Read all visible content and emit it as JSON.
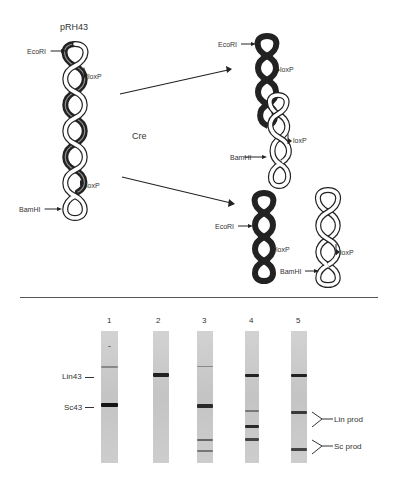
{
  "figure": {
    "top_panel": {
      "plasmid_name": "pRH43",
      "enzyme_label": "Cre",
      "substrate": {
        "labels": {
          "eco": "EcoRI",
          "loxp_top": "loxP",
          "loxp_bottom": "loxP",
          "bam": "BamHI"
        }
      },
      "product_top": {
        "labels": {
          "eco": "EcoRI",
          "loxp_top": "loxP",
          "loxp_bottom": "loxP",
          "bam": "BamHI"
        }
      },
      "product_bottom_left": {
        "labels": {
          "eco": "EcoRI",
          "loxp": "loxP"
        }
      },
      "product_bottom_right": {
        "labels": {
          "loxp": "loxP",
          "bam": "BamHI"
        }
      }
    },
    "gel_panel": {
      "lanes": [
        {
          "number": "1",
          "bands": [
            {
              "y": 0.12,
              "weight": "faint"
            },
            {
              "y": 0.27,
              "weight": "medium-faint"
            },
            {
              "y": 0.55,
              "weight": "strong"
            }
          ]
        },
        {
          "number": "2",
          "bands": [
            {
              "y": 0.33,
              "weight": "strong"
            }
          ]
        },
        {
          "number": "3",
          "bands": [
            {
              "y": 0.27,
              "weight": "faint"
            },
            {
              "y": 0.56,
              "weight": "strong"
            },
            {
              "y": 0.83,
              "weight": "medium-faint"
            },
            {
              "y": 0.91,
              "weight": "medium-faint"
            }
          ]
        },
        {
          "number": "4",
          "bands": [
            {
              "y": 0.33,
              "weight": "strong"
            },
            {
              "y": 0.6,
              "weight": "medium-faint"
            },
            {
              "y": 0.72,
              "weight": "strong"
            },
            {
              "y": 0.82,
              "weight": "medium"
            }
          ]
        },
        {
          "number": "5",
          "bands": [
            {
              "y": 0.33,
              "weight": "strong"
            },
            {
              "y": 0.62,
              "weight": "medium"
            },
            {
              "y": 0.89,
              "weight": "medium"
            }
          ]
        }
      ],
      "left_markers": {
        "lin": "Lin43",
        "sc": "Sc43"
      },
      "right_markers": {
        "lin_prod": "Lin prod",
        "sc_prod": "Sc prod"
      }
    }
  },
  "colors": {
    "ink": "#222222",
    "lane_bg": "#c9c9c9",
    "band_strong": "#1a1a1a",
    "band_medium": "#4a4a4a",
    "band_faint": "#8a8a8a"
  }
}
